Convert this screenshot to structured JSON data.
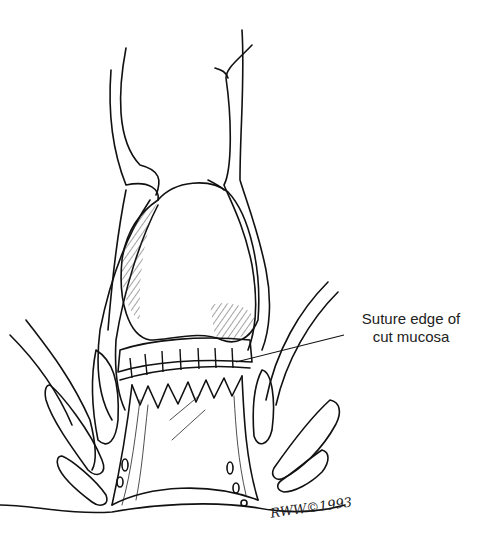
{
  "figure": {
    "type": "medical-line-illustration"
  },
  "labels": {
    "suture_edge": {
      "line1": "Suture edge of",
      "line2": "cut mucosa"
    }
  },
  "signature": {
    "text": "RWW©1993"
  },
  "colors": {
    "ink": "#111111",
    "background": "#ffffff"
  }
}
